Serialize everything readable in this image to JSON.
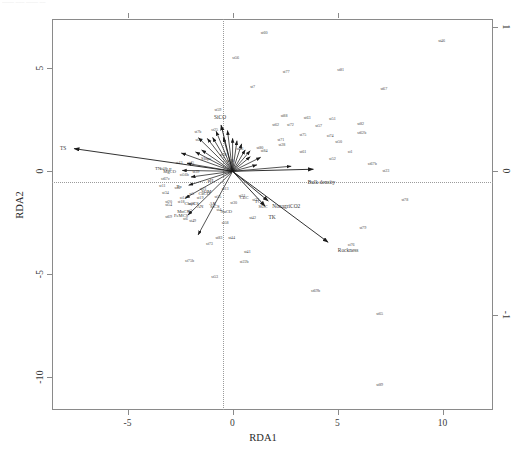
{
  "figure": {
    "type": "rda-ordination-biplot",
    "top_artifact_text": "—— ––– —— ––",
    "frame": {
      "x0": 52,
      "y0": 19,
      "x1": 493,
      "y1": 410
    }
  },
  "axes": {
    "x_title": "RDA1",
    "y_title": "RDA2",
    "x_ticks": [
      {
        "label": "-5",
        "value": -5
      },
      {
        "label": "0",
        "value": 0
      },
      {
        "label": "5",
        "value": 5
      },
      {
        "label": "10",
        "value": 10
      }
    ],
    "y_ticks": [
      {
        "label": "5",
        "value": 5
      },
      {
        "label": "0",
        "value": 0
      },
      {
        "label": "-5",
        "value": -5
      },
      {
        "label": "-10",
        "value": -10
      }
    ],
    "x_ticks_top": [
      {
        "label": "",
        "value": -5
      },
      {
        "label": "",
        "value": 0
      },
      {
        "label": "",
        "value": 5
      }
    ],
    "y_ticks_right": [
      {
        "label": "1",
        "value": 1
      },
      {
        "label": "0",
        "value": 0
      },
      {
        "label": "-1",
        "value": -1
      }
    ],
    "xlim": [
      -8.6,
      12.4
    ],
    "ylim": [
      -11.6,
      7.4
    ],
    "grid": false,
    "zero_reference_lines": true
  },
  "chart_data": {
    "type": "scatter",
    "title": "",
    "subtitle": "",
    "xlabel": "RDA1",
    "ylabel": "RDA2",
    "xlim": [
      -8.6,
      12.4
    ],
    "ylim": [
      -11.6,
      7.4
    ],
    "grid": false,
    "legend": "none",
    "annotations": [
      "SiCO",
      "TS",
      "Bulk density",
      "Rockness",
      "NonagriCO2",
      "TK"
    ],
    "series": [
      {
        "name": "sites",
        "marker": "text-label",
        "points": [
          {
            "label": "st60",
            "x": 1.5,
            "y": 6.75
          },
          {
            "label": "st56",
            "x": 0.15,
            "y": 5.55
          },
          {
            "label": "st77",
            "x": 2.55,
            "y": 4.85
          },
          {
            "label": "st81",
            "x": 5.15,
            "y": 4.95
          },
          {
            "label": "st7",
            "x": 0.95,
            "y": 4.15
          },
          {
            "label": "st67",
            "x": 7.2,
            "y": 4.05
          },
          {
            "label": "st59",
            "x": -0.7,
            "y": 3.05
          },
          {
            "label": "st88",
            "x": 2.45,
            "y": 2.75
          },
          {
            "label": "st63",
            "x": 3.55,
            "y": 2.65
          },
          {
            "label": "st51",
            "x": 4.75,
            "y": 2.6
          },
          {
            "label": "st62",
            "x": 2.05,
            "y": 2.3
          },
          {
            "label": "st72",
            "x": 2.75,
            "y": 2.3
          },
          {
            "label": "st57",
            "x": 4.1,
            "y": 2.25
          },
          {
            "label": "st82",
            "x": 6.1,
            "y": 2.35
          },
          {
            "label": "st25",
            "x": -0.85,
            "y": 2.05
          },
          {
            "label": "st7b",
            "x": -1.65,
            "y": 1.95
          },
          {
            "label": "st62b",
            "x": 6.15,
            "y": 1.9
          },
          {
            "label": "st75",
            "x": 3.35,
            "y": 1.8
          },
          {
            "label": "st74",
            "x": 4.65,
            "y": 1.75
          },
          {
            "label": "st22",
            "x": -1.6,
            "y": 1.55
          },
          {
            "label": "st71",
            "x": 2.3,
            "y": 1.55
          },
          {
            "label": "st28",
            "x": 2.35,
            "y": 1.35
          },
          {
            "label": "st50",
            "x": 5.05,
            "y": 1.45
          },
          {
            "label": "st84",
            "x": 1.5,
            "y": 1.05
          },
          {
            "label": "st61",
            "x": 3.35,
            "y": 1.0
          },
          {
            "label": "st1",
            "x": 5.6,
            "y": 1.0
          },
          {
            "label": "st36",
            "x": 0.35,
            "y": 1.15
          },
          {
            "label": "st80",
            "x": 1.3,
            "y": 1.2
          },
          {
            "label": "st52",
            "x": 4.75,
            "y": 0.65
          },
          {
            "label": "st67b",
            "x": 6.65,
            "y": 0.4
          },
          {
            "label": "st23",
            "x": 7.3,
            "y": 0.05
          },
          {
            "label": "st38",
            "x": -0.45,
            "y": 0.85
          },
          {
            "label": "st70",
            "x": -0.1,
            "y": 0.55
          },
          {
            "label": "st43",
            "x": -2.55,
            "y": 0.45
          },
          {
            "label": "st45",
            "x": -2.0,
            "y": 0.45
          },
          {
            "label": "st48",
            "x": -3.3,
            "y": 0.15
          },
          {
            "label": "st39",
            "x": -1.75,
            "y": 0.0
          },
          {
            "label": "st56b",
            "x": -2.3,
            "y": -0.15
          },
          {
            "label": "st67c",
            "x": -3.2,
            "y": -0.35
          },
          {
            "label": "st11",
            "x": -3.35,
            "y": -0.65
          },
          {
            "label": "st8",
            "x": -2.65,
            "y": -0.75
          },
          {
            "label": "st21",
            "x": -1.4,
            "y": -0.8
          },
          {
            "label": "st13",
            "x": -0.35,
            "y": -0.8
          },
          {
            "label": "st34",
            "x": -3.2,
            "y": -1.0
          },
          {
            "label": "st5",
            "x": -1.95,
            "y": -1.05
          },
          {
            "label": "st14",
            "x": -2.35,
            "y": -1.25
          },
          {
            "label": "st19",
            "x": -1.55,
            "y": -1.25
          },
          {
            "label": "st55",
            "x": -0.7,
            "y": -1.2
          },
          {
            "label": "st31",
            "x": 0.45,
            "y": -1.15
          },
          {
            "label": "st33",
            "x": 1.1,
            "y": -1.35
          },
          {
            "label": "st30",
            "x": 0.05,
            "y": -1.5
          },
          {
            "label": "st20",
            "x": -3.05,
            "y": -1.45
          },
          {
            "label": "st18",
            "x": -2.45,
            "y": -1.45
          },
          {
            "label": "st54",
            "x": -3.05,
            "y": -1.6
          },
          {
            "label": "st26",
            "x": -1.95,
            "y": -1.55
          },
          {
            "label": "st78",
            "x": 8.2,
            "y": -1.35
          },
          {
            "label": "st4",
            "x": -0.65,
            "y": -1.85
          },
          {
            "label": "st3",
            "x": -2.05,
            "y": -1.9
          },
          {
            "label": "st42",
            "x": 0.95,
            "y": -2.2
          },
          {
            "label": "st69",
            "x": -3.05,
            "y": -2.15
          },
          {
            "label": "st6",
            "x": -2.25,
            "y": -2.25
          },
          {
            "label": "st49",
            "x": -1.9,
            "y": -2.35
          },
          {
            "label": "st58",
            "x": -0.35,
            "y": -2.45
          },
          {
            "label": "st79",
            "x": 6.2,
            "y": -2.7
          },
          {
            "label": "st44",
            "x": -0.05,
            "y": -3.2
          },
          {
            "label": "st83",
            "x": -0.65,
            "y": -3.2
          },
          {
            "label": "st73",
            "x": -1.1,
            "y": -3.5
          },
          {
            "label": "st76",
            "x": 5.65,
            "y": -3.55
          },
          {
            "label": "st41",
            "x": 0.7,
            "y": -3.85
          },
          {
            "label": "st22b",
            "x": 0.55,
            "y": -4.35
          },
          {
            "label": "st75b",
            "x": -2.05,
            "y": -4.3
          },
          {
            "label": "st53",
            "x": -0.85,
            "y": -5.1
          },
          {
            "label": "st69b",
            "x": 3.95,
            "y": -5.75
          },
          {
            "label": "st65",
            "x": 7.0,
            "y": -6.9
          },
          {
            "label": "st89",
            "x": 7.0,
            "y": -10.35
          },
          {
            "label": "st46",
            "x": 9.95,
            "y": 6.4
          }
        ]
      }
    ],
    "vectors": [
      {
        "label": "TS",
        "x0": 0,
        "y0": 0,
        "x1": -7.55,
        "y1": 1.1
      },
      {
        "label": "SiCO",
        "x0": 0,
        "y0": 0,
        "x1": -0.55,
        "y1": 2.25
      },
      {
        "label": "Bulk density",
        "x0": 0,
        "y0": 0,
        "x1": 3.85,
        "y1": 0.1
      },
      {
        "label": "Rockness",
        "x0": 0,
        "y0": 0,
        "x1": 4.55,
        "y1": -3.45
      },
      {
        "label": "NonagriCO2",
        "x0": 0,
        "y0": 0,
        "x1": 1.7,
        "y1": -1.45
      },
      {
        "label": "TK",
        "x0": 0,
        "y0": 0,
        "x1": 1.55,
        "y1": -1.7
      }
    ],
    "cluster_labels": [
      {
        "label": "TN",
        "x": -3.55,
        "y": 0.15
      },
      {
        "label": "AP",
        "x": -3.05,
        "y": 0.1
      },
      {
        "label": "Slope",
        "x": -1.25,
        "y": 0.65
      },
      {
        "label": "MgCO",
        "x": -3.0,
        "y": 0.0
      },
      {
        "label": "Tp",
        "x": -2.55,
        "y": -0.7
      },
      {
        "label": "pH",
        "x": -1.05,
        "y": -0.4
      },
      {
        "label": "SOM",
        "x": -1.25,
        "y": -0.95
      },
      {
        "label": "CaCO",
        "x": -1.35,
        "y": -1.05
      },
      {
        "label": "AN",
        "x": -1.55,
        "y": -1.7
      },
      {
        "label": "AK",
        "x": -0.95,
        "y": -1.55
      },
      {
        "label": "ClayCS",
        "x": -1.95,
        "y": -1.55
      },
      {
        "label": "SiCS",
        "x": -0.85,
        "y": -1.7
      },
      {
        "label": "MnCS",
        "x": -2.35,
        "y": -1.95
      },
      {
        "label": "FeMCS",
        "x": -2.45,
        "y": -2.1
      },
      {
        "label": "NaCO",
        "x": -0.3,
        "y": -1.95
      },
      {
        "label": "CEC",
        "x": 0.55,
        "y": -1.25
      },
      {
        "label": "TC",
        "x": 1.2,
        "y": -1.45
      },
      {
        "label": "SOC",
        "x": 1.45,
        "y": -1.7
      }
    ]
  }
}
